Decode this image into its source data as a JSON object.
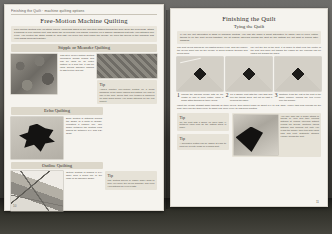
{
  "document": {
    "kind": "book-spread",
    "left_page_number": "10",
    "right_page_number": "11"
  },
  "left_page": {
    "running_head": "Finishing the Quilt  ·  machine quilting options",
    "title": "Free-Motion Machine Quilting",
    "intro": "Free-motion quilting lets you stitch curves, loops and swirls in any direction without turning the quilt. Drop the feed dogs, attach a darning or free-motion foot, and guide the layers with your hands. Practice on a sample sandwich first until your stitches look even. You control the stitch length by how fast you move the quilt under the needle, so keep the speed of the machine and your hands working together.",
    "sections": [
      {
        "heading": "Stipple or Meander Quilting",
        "body": "This style of free-motion quilting meanders across seams and can be used on an entire pattern or a quilt top. It can be used around appliqué shapes to add texture and loft.",
        "photo_name": "stipple-quilting-sample"
      },
      {
        "heading": "Echo Quilting",
        "body": "Echo quilting is stitching around the shape of a motif or design, repeating a parallel line. The space between the quilting lines should be between 1/4\" and 1/2\" apart.",
        "photo_name": "echo-quilting-leaf-sample"
      },
      {
        "heading": "Outline Quilting",
        "body": "Outline quilting is sewing a 1/4\" away from a seam line or the edge of an appliqué shape.",
        "photo_name": "outline-quilting-sample"
      }
    ],
    "tips": [
      {
        "heading": "Tip",
        "body": "Always practice free-motion quilting on a scrap sandwich of the same fabrics and batting you plan to use in the quilt. Check that your tension is balanced on both sides before you begin stitching on the real project."
      },
      {
        "heading": "Tip",
        "body": "Use quilting gloves or rubber finger grips to help you move the layers smoothly and keep your stitches an even length."
      }
    ]
  },
  "right_page": {
    "title": "Finishing the Quilt",
    "subtitle": "Tying the Quilt",
    "intro": "If you are not interested in hand or machine quilting, you can still make a great alternative to using yarn or perle cotton thread to tie the quilt layers together. Tie at regular intervals across the quilt so the batting will not shift or bunch after washing.",
    "columns": [
      "The quilt layers should be pin-basted before tying. This will ensure the layers won't slip as the needle is being pushed through and pulled back.",
      "Lay out the top of the quilt. It is easier to start near the centre of the quilt and work out toward the edges so any fullness can be eased out toward the sides."
    ],
    "steps": [
      {
        "number": "1",
        "caption": "Thread the darning needle with an 18\" length of yarn or perle cotton. Make a single stitch through all three layers.",
        "photo_name": "tying-step-1-photo"
      },
      {
        "number": "2",
        "caption": "Tie a square knot with the yarn tails and pull the thread snug, but not so tight it puckers the fabric.",
        "photo_name": "tying-step-2-photo"
      },
      {
        "number": "3",
        "caption": "Continue tying the rest of the quilt in the same manner, placing the ties evenly over the surface.",
        "photo_name": "tying-step-3-photo"
      }
    ],
    "body_text": "Insert the needle straight down through all three layers, then bring it back up about 1/4\" to 1/2\" away. Leave tails long enough for the knot, then clip the tails evenly to about 1/2\" once every tie has been knotted.",
    "tips": [
      {
        "heading": "Tip",
        "body": "Tie the quilt with a space no more than 4\" between each knot so the batting stays in place."
      },
      {
        "heading": "Tip",
        "body": "A decorative button can be added at each tie point for a pretty finish on a child's quilt."
      }
    ],
    "feature": {
      "photo_name": "tied-quilt-closeup-photo",
      "caption": "You may also use a single strand of thread or yarn and take running stitches at regular intervals without pulling the thread. Continue taking stitches and working out until you reach the border, then trim with equal tails and knot. Distribute stitches equally across the quilt."
    }
  }
}
